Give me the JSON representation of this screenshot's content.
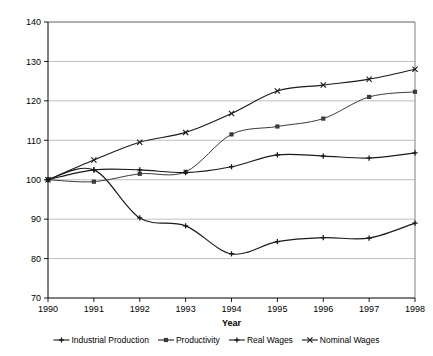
{
  "chart_data": {
    "type": "line",
    "title": "",
    "xlabel": "Year",
    "ylabel": "",
    "x": [
      1990,
      1991,
      1992,
      1993,
      1994,
      1995,
      1996,
      1997,
      1998
    ],
    "categories": [
      "1990",
      "1991",
      "1992",
      "1993",
      "1994",
      "1995",
      "1996",
      "1997",
      "1998"
    ],
    "xlim": [
      1990,
      1998
    ],
    "ylim": [
      70,
      140
    ],
    "yticks": [
      70,
      80,
      90,
      100,
      110,
      120,
      130,
      140
    ],
    "xticks": [
      "1990",
      "1991",
      "1992",
      "1993",
      "1994",
      "1995",
      "1996",
      "1997",
      "1998"
    ],
    "grid": "horizontal",
    "legend_position": "bottom",
    "smoothing": "spline",
    "series": [
      {
        "name": "Industrial Production",
        "marker": "plus",
        "color": "#1a1a1a",
        "values": [
          100,
          102.5,
          90.3,
          88.3,
          81.2,
          84.3,
          85.3,
          85.2,
          89.0
        ]
      },
      {
        "name": "Productivity",
        "marker": "square",
        "color": "#3a3a3a",
        "values": [
          100,
          99.5,
          101.5,
          102.0,
          111.5,
          113.5,
          115.5,
          121.0,
          122.3
        ]
      },
      {
        "name": "Real Wages",
        "marker": "plus",
        "color": "#1a1a1a",
        "values": [
          100,
          102.5,
          102.5,
          101.8,
          103.3,
          106.3,
          106.0,
          105.5,
          106.8
        ]
      },
      {
        "name": "Nominal Wages",
        "marker": "cross",
        "color": "#1a1a1a",
        "values": [
          100,
          105.0,
          109.5,
          112.0,
          116.8,
          122.5,
          124.0,
          125.5,
          128.0
        ]
      }
    ]
  },
  "legend": {
    "items": [
      {
        "label": "Industrial Production",
        "marker": "plus"
      },
      {
        "label": "Productivity",
        "marker": "square"
      },
      {
        "label": "Real Wages",
        "marker": "plus"
      },
      {
        "label": "Nominal Wages",
        "marker": "cross"
      }
    ]
  },
  "axes": {
    "x_title": "Year",
    "y_title": ""
  }
}
